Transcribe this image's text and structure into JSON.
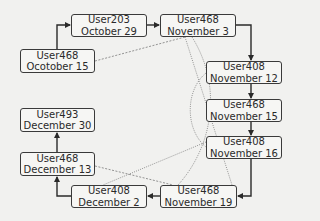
{
  "diagram": {
    "type": "flow",
    "nodes": [
      {
        "id": "n1",
        "user": "User468",
        "date": "Ocotober 15",
        "box": [
          20,
          49,
          75,
          24
        ]
      },
      {
        "id": "n2",
        "user": "User203",
        "date": "October 29",
        "box": [
          71,
          14,
          76,
          23
        ]
      },
      {
        "id": "n3",
        "user": "User468",
        "date": "November 3",
        "box": [
          160,
          14,
          76,
          23
        ]
      },
      {
        "id": "n4",
        "user": "User408",
        "date": "November 12",
        "box": [
          206,
          61,
          76,
          23
        ]
      },
      {
        "id": "n5",
        "user": "User468",
        "date": "November 15",
        "box": [
          206,
          99,
          76,
          23
        ]
      },
      {
        "id": "n6",
        "user": "User408",
        "date": "November 16",
        "box": [
          206,
          136,
          76,
          23
        ]
      },
      {
        "id": "n7",
        "user": "User468",
        "date": "November 19",
        "box": [
          160,
          185,
          77,
          23
        ]
      },
      {
        "id": "n8",
        "user": "User408",
        "date": "December 2",
        "box": [
          71,
          185,
          76,
          23
        ]
      },
      {
        "id": "n9",
        "user": "User468",
        "date": "December 13",
        "box": [
          20,
          152,
          75,
          24
        ]
      },
      {
        "id": "n10",
        "user": "User493",
        "date": "December 30",
        "box": [
          20,
          108,
          75,
          24
        ]
      }
    ],
    "edges": [
      {
        "from": "n1",
        "to": "n2",
        "style": "solid-arrow"
      },
      {
        "from": "n2",
        "to": "n3",
        "style": "solid-arrow"
      },
      {
        "from": "n3",
        "to": "n4",
        "style": "solid-arrow"
      },
      {
        "from": "n4",
        "to": "n5",
        "style": "solid-arrow"
      },
      {
        "from": "n5",
        "to": "n6",
        "style": "solid-arrow"
      },
      {
        "from": "n6",
        "to": "n7",
        "style": "solid-arrow"
      },
      {
        "from": "n7",
        "to": "n8",
        "style": "solid-arrow"
      },
      {
        "from": "n8",
        "to": "n9",
        "style": "solid-arrow"
      },
      {
        "from": "n9",
        "to": "n10",
        "style": "solid-arrow"
      }
    ],
    "same_user_links": [
      {
        "user": "User468",
        "between": [
          "n1",
          "n3"
        ],
        "style": "dashed"
      },
      {
        "user": "User468",
        "between": [
          "n3",
          "n7"
        ],
        "style": "dotted"
      },
      {
        "user": "User468",
        "between": [
          "n7",
          "n9"
        ],
        "style": "dashed"
      },
      {
        "user": "User468",
        "between": [
          "n3",
          "n5"
        ],
        "style": "dotted-curve"
      },
      {
        "user": "User468",
        "between": [
          "n5",
          "n7"
        ],
        "style": "dotted-curve"
      },
      {
        "user": "User408",
        "between": [
          "n4",
          "n6"
        ],
        "style": "dotted-curve"
      },
      {
        "user": "User408",
        "between": [
          "n6",
          "n8"
        ],
        "style": "dotted"
      }
    ],
    "colors": {
      "background": "#f1f1ef",
      "node_border": "#3a3a3a",
      "node_fill": "#f6f6f4",
      "text": "#2a2a2a",
      "arrow": "#2a2a2a",
      "link": "#7a7a7a"
    }
  }
}
